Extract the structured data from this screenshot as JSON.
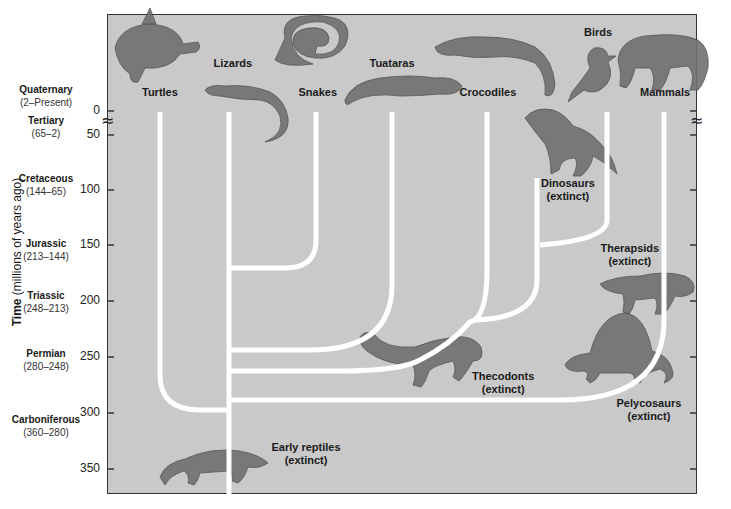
{
  "figure": {
    "axis": {
      "label_bold": "Time",
      "label_rest": " (millions of years ago)",
      "ticks": [
        {
          "value": "0",
          "y": 111
        },
        {
          "value": "50",
          "y": 135
        },
        {
          "value": "100",
          "y": 190
        },
        {
          "value": "150",
          "y": 245
        },
        {
          "value": "200",
          "y": 301
        },
        {
          "value": "250",
          "y": 357
        },
        {
          "value": "300",
          "y": 413
        },
        {
          "value": "350",
          "y": 469
        }
      ],
      "break_symbol": "≈"
    },
    "eras": [
      {
        "name": "Quaternary",
        "range": "(2–Present)",
        "y": 96
      },
      {
        "name": "Tertiary",
        "range": "(65–2)",
        "y": 127
      },
      {
        "name": "Cretaceous",
        "range": "(144–65)",
        "y": 185
      },
      {
        "name": "Jurassic",
        "range": "(213–144)",
        "y": 250
      },
      {
        "name": "Triassic",
        "range": "(248–213)",
        "y": 302
      },
      {
        "name": "Permian",
        "range": "(280–248)",
        "y": 360
      },
      {
        "name": "Carboniferous",
        "range": "(360–280)",
        "y": 426
      }
    ],
    "taxa": [
      {
        "name": "Turtles",
        "extinct": "",
        "x": 160,
        "y": 92
      },
      {
        "name": "Lizards",
        "extinct": "",
        "x": 233,
        "y": 63
      },
      {
        "name": "Snakes",
        "extinct": "",
        "x": 318,
        "y": 92
      },
      {
        "name": "Tuataras",
        "extinct": "",
        "x": 392,
        "y": 63
      },
      {
        "name": "Crocodiles",
        "extinct": "",
        "x": 488,
        "y": 92
      },
      {
        "name": "Birds",
        "extinct": "",
        "x": 598,
        "y": 32
      },
      {
        "name": "Mammals",
        "extinct": "",
        "x": 665,
        "y": 92
      },
      {
        "name": "Dinosaurs",
        "extinct": "(extinct)",
        "x": 568,
        "y": 183
      },
      {
        "name": "Therapsids",
        "extinct": "(extinct)",
        "x": 630,
        "y": 248
      },
      {
        "name": "Thecodonts",
        "extinct": "(extinct)",
        "x": 503,
        "y": 376
      },
      {
        "name": "Pelycosaurs",
        "extinct": "(extinct)",
        "x": 649,
        "y": 403
      },
      {
        "name": "Early reptiles",
        "extinct": "(extinct)",
        "x": 306,
        "y": 447
      }
    ],
    "animals": [
      {
        "name": "turtle",
        "x": 150,
        "y": 48
      },
      {
        "name": "lizard",
        "x": 240,
        "y": 98
      },
      {
        "name": "snake",
        "x": 315,
        "y": 48
      },
      {
        "name": "tuatara",
        "x": 400,
        "y": 88
      },
      {
        "name": "crocodile",
        "x": 495,
        "y": 55
      },
      {
        "name": "bird",
        "x": 592,
        "y": 70
      },
      {
        "name": "tiger",
        "x": 660,
        "y": 62
      },
      {
        "name": "tyrannosaur",
        "x": 565,
        "y": 140
      },
      {
        "name": "therapsid",
        "x": 645,
        "y": 290
      },
      {
        "name": "thecodont",
        "x": 425,
        "y": 355
      },
      {
        "name": "dimetrodon",
        "x": 620,
        "y": 355
      },
      {
        "name": "early-reptile",
        "x": 220,
        "y": 465
      }
    ],
    "colors": {
      "panel": "#c9c9c9",
      "branch": "#ffffff",
      "frame": "#333333",
      "animal": "#6e6e6e"
    }
  }
}
